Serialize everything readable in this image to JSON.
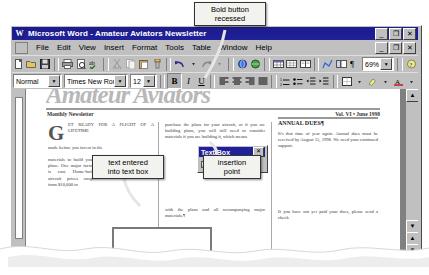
{
  "app": {
    "title": "Microsoft Word - Amateur Aviators Newsletter",
    "icon": "word-icon",
    "window_buttons": {
      "minimize": "_",
      "restore": "❐",
      "close": "✕"
    },
    "doc_window_buttons": {
      "minimize": "_",
      "restore": "❐",
      "close": "✕"
    }
  },
  "menu": {
    "items": [
      "File",
      "Edit",
      "View",
      "Insert",
      "Format",
      "Tools",
      "Table",
      "Window",
      "Help"
    ]
  },
  "standard_toolbar": {
    "buttons": [
      "new-icon",
      "open-icon",
      "save-icon",
      "print-icon",
      "print-preview-icon",
      "spelling-icon",
      "cut-icon",
      "copy-icon",
      "paste-icon",
      "format-painter-icon",
      "undo-icon",
      "redo-icon",
      "insert-hyperlink-icon",
      "web-toolbar-icon",
      "insert-table-icon",
      "insert-excel-table-icon",
      "columns-icon",
      "drawing-icon",
      "document-map-icon",
      "show-hide-paragraph-icon"
    ],
    "zoom": {
      "label": "zoom-level",
      "value": "69%"
    },
    "help": "office-assistant-icon"
  },
  "formatting_toolbar": {
    "style": {
      "value": "Normal",
      "name": "style-combo"
    },
    "font": {
      "value": "Times New Roman",
      "name": "font-combo"
    },
    "size": {
      "value": "12",
      "name": "font-size-combo"
    },
    "bold": {
      "label": "B",
      "pressed": true
    },
    "italic": {
      "label": "I",
      "pressed": false
    },
    "underline": {
      "label": "U",
      "pressed": false
    },
    "align": [
      "align-left-icon",
      "align-center-icon",
      "align-right-icon",
      "justify-icon"
    ],
    "lists": [
      "numbered-list-icon",
      "bulleted-list-icon",
      "decrease-indent-icon",
      "increase-indent-icon"
    ],
    "extras": [
      "borders-icon",
      "highlight-icon",
      "font-color-icon"
    ]
  },
  "text_box_toolbar": {
    "title": "Text Box",
    "close": "✕",
    "buttons": [
      "change-text-direction-icon",
      "previous-textbox-icon",
      "next-textbox-icon",
      "break-link-icon",
      "create-link-icon"
    ]
  },
  "document": {
    "masthead": "Amateur Aviators",
    "header_left": "Monthly Newsletter",
    "header_right": "Vol. VI • June 1998",
    "dropcap": "G",
    "col1_top": "ET READY FOR A FLIGHT OF A LIFETIME",
    "col1_text": "made before you invest in the",
    "col1_text2": "materials to build your plane. One major factor is cost. Home-built aircraft prices range from $10,000 to",
    "col2_text": "purchase the plans for your aircraft, or if you are building plans, you will still need to consider materials if you are building it, which means",
    "col2_text2": "with the plans and all accompanying major materials.¶",
    "col3_heading": "ANNUAL DUES¶",
    "col3_text": "It's that time of year again. Annual dues must be received by August 15, 1998. We need your continued support.",
    "col3_text2": "If you have not yet paid your dues, please send a check",
    "banner_text": "HOW TO BUILD A PLANE¶",
    "textbox_content": ""
  },
  "callouts": [
    {
      "id": "bold-button-recessed",
      "line1": "Bold button",
      "line2": "recessed"
    },
    {
      "id": "text-entered-into-text-box",
      "line1": "text entered",
      "line2": "into text box"
    },
    {
      "id": "insertion-point",
      "line1": "insertion",
      "line2": "point"
    }
  ],
  "scrollbar": {
    "up": "▲",
    "down": "▼",
    "prev_page": "▲",
    "next_page": "▼"
  }
}
